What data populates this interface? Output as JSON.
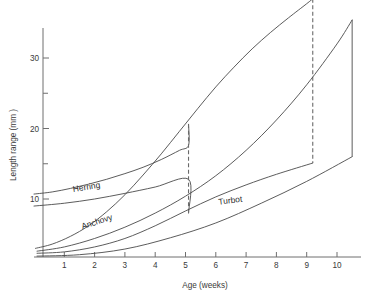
{
  "chart_data": {
    "type": "line",
    "title": "",
    "xlabel": "Age (weeks)",
    "ylabel": "Length range (mm )",
    "xlim": [
      0,
      11.2
    ],
    "ylim": [
      0,
      40
    ],
    "grid": false,
    "legend_position": "inline-labels",
    "x_ticks": [
      1,
      2,
      3,
      4,
      5,
      6,
      7,
      8,
      9,
      10
    ],
    "x_tick_labels": [
      "1",
      "2",
      "3",
      "4",
      "5",
      "6",
      "7",
      "8",
      "9",
      "10"
    ],
    "y_ticks": [
      10,
      15,
      20,
      25,
      30
    ],
    "y_tick_labels": [
      "10",
      "",
      "20",
      "",
      "30"
    ],
    "y_major_labels": [
      "10",
      "20",
      "30"
    ],
    "series": [
      {
        "name": "Herring",
        "label": "Herring",
        "style": "solid",
        "closure": "dashed-vertical",
        "upper": [
          {
            "x": 0.0,
            "y": 10.7
          },
          {
            "x": 0.6,
            "y": 11.0
          },
          {
            "x": 1.2,
            "y": 11.5
          },
          {
            "x": 1.8,
            "y": 12.1
          },
          {
            "x": 2.4,
            "y": 12.8
          },
          {
            "x": 3.0,
            "y": 13.6
          },
          {
            "x": 3.6,
            "y": 14.5
          },
          {
            "x": 4.2,
            "y": 15.6
          },
          {
            "x": 4.8,
            "y": 16.9
          },
          {
            "x": 5.1,
            "y": 17.6
          }
        ],
        "lower": [
          {
            "x": 0.0,
            "y": 9.0
          },
          {
            "x": 1.0,
            "y": 9.4
          },
          {
            "x": 2.0,
            "y": 10.0
          },
          {
            "x": 3.0,
            "y": 10.8
          },
          {
            "x": 4.0,
            "y": 11.7
          },
          {
            "x": 5.1,
            "y": 12.8
          }
        ],
        "close_x": 5.1,
        "close_y_top": 20.6,
        "close_y_bottom": 8.0,
        "peak_x": 5.1,
        "peak_y": 20.6
      },
      {
        "name": "Anchovy",
        "label": "Anchovy",
        "style": "solid",
        "closure": "dashed-vertical",
        "upper": [
          {
            "x": 0.05,
            "y": 3.0
          },
          {
            "x": 0.6,
            "y": 3.6
          },
          {
            "x": 1.2,
            "y": 4.7
          },
          {
            "x": 1.8,
            "y": 6.2
          },
          {
            "x": 2.4,
            "y": 8.2
          },
          {
            "x": 3.0,
            "y": 10.6
          },
          {
            "x": 3.6,
            "y": 13.4
          },
          {
            "x": 4.2,
            "y": 16.4
          },
          {
            "x": 4.8,
            "y": 19.6
          },
          {
            "x": 5.4,
            "y": 22.8
          },
          {
            "x": 6.0,
            "y": 25.9
          },
          {
            "x": 6.6,
            "y": 28.7
          },
          {
            "x": 7.2,
            "y": 31.3
          },
          {
            "x": 7.8,
            "y": 33.6
          },
          {
            "x": 8.4,
            "y": 35.7
          },
          {
            "x": 9.0,
            "y": 37.7
          },
          {
            "x": 9.2,
            "y": 38.4
          }
        ],
        "lower": [
          {
            "x": 0.1,
            "y": 2.3
          },
          {
            "x": 1.0,
            "y": 2.5
          },
          {
            "x": 2.0,
            "y": 3.2
          },
          {
            "x": 3.0,
            "y": 4.4
          },
          {
            "x": 4.0,
            "y": 6.2
          },
          {
            "x": 5.0,
            "y": 8.3
          },
          {
            "x": 6.0,
            "y": 10.3
          },
          {
            "x": 7.0,
            "y": 12.0
          },
          {
            "x": 8.0,
            "y": 13.5
          },
          {
            "x": 9.2,
            "y": 15.1
          }
        ],
        "close_x": 9.2,
        "close_y_top": 38.4,
        "close_y_bottom": 15.1,
        "peak_x": 9.2,
        "peak_y": 38.4
      },
      {
        "name": "Turbot",
        "label": "Turbot",
        "style": "solid",
        "closure": "solid-vertical",
        "upper": [
          {
            "x": 0.1,
            "y": 2.6
          },
          {
            "x": 1.0,
            "y": 3.2
          },
          {
            "x": 2.0,
            "y": 4.4
          },
          {
            "x": 3.0,
            "y": 6.0
          },
          {
            "x": 4.0,
            "y": 8.0
          },
          {
            "x": 5.0,
            "y": 10.4
          },
          {
            "x": 6.0,
            "y": 13.3
          },
          {
            "x": 7.0,
            "y": 16.9
          },
          {
            "x": 8.0,
            "y": 21.2
          },
          {
            "x": 9.0,
            "y": 26.2
          },
          {
            "x": 10.0,
            "y": 32.0
          },
          {
            "x": 10.5,
            "y": 35.4
          }
        ],
        "lower": [
          {
            "x": 0.1,
            "y": 1.9
          },
          {
            "x": 1.5,
            "y": 2.1
          },
          {
            "x": 3.0,
            "y": 2.9
          },
          {
            "x": 4.5,
            "y": 4.5
          },
          {
            "x": 6.0,
            "y": 6.6
          },
          {
            "x": 7.5,
            "y": 9.4
          },
          {
            "x": 9.0,
            "y": 12.5
          },
          {
            "x": 10.5,
            "y": 16.0
          }
        ],
        "close_x": 10.5,
        "close_y_top": 35.4,
        "close_y_bottom": 16.0,
        "peak_x": 10.5,
        "peak_y": 35.4
      }
    ],
    "annotations": [
      {
        "text": "Herring",
        "x": 1.3,
        "y": 11.0,
        "rotation": -9
      },
      {
        "text": "Anchovy",
        "x": 1.6,
        "y": 5.7,
        "rotation": -18
      },
      {
        "text": "Turbot",
        "x": 6.1,
        "y": 9.2,
        "rotation": -7
      }
    ]
  },
  "colors": {
    "background": "#ffffff",
    "axis": "#6f6f6f",
    "curve": "#4a4a4a",
    "closure_dashed": "#6a6a6a",
    "text": "#2b2b2b"
  }
}
